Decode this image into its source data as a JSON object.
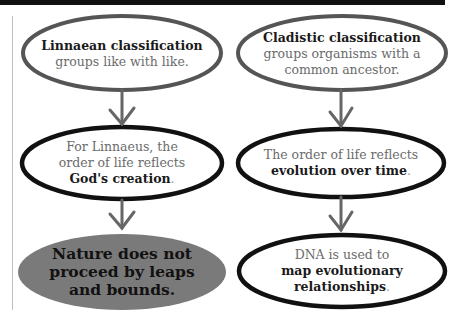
{
  "colors": {
    "top_oval_stroke": "#555555",
    "mid_oval_stroke": "#111111",
    "filled_oval": "#7a7a7a",
    "arrow": "#666666",
    "emphasis_text": "#1a1a1a",
    "body_text": "#6b6b6b"
  },
  "left_column": {
    "box1": {
      "title": "Linnaean classification",
      "text": "groups like with like."
    },
    "box2": {
      "line1": "For Linnaeus, the",
      "line2": "order of life reflects",
      "emphasis": "God's creation",
      "end": "."
    },
    "box3": {
      "line1": "Nature does not",
      "line2": "proceed by leaps",
      "line3": "and bounds."
    }
  },
  "right_column": {
    "box1": {
      "title": "Cladistic classification",
      "line1": "groups organisms with a",
      "line2": "common ancestor."
    },
    "box2": {
      "line1": "The order of life reflects",
      "emphasis": "evolution over time",
      "end": "."
    },
    "box3": {
      "line1": "DNA is used to",
      "emphasis1": "map evolutionary",
      "emphasis2": "relationships",
      "end": "."
    }
  }
}
